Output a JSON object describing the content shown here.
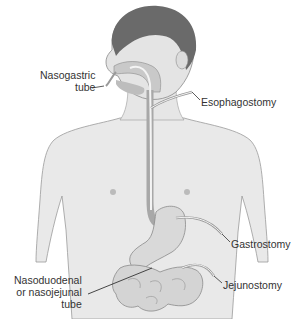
{
  "figure": {
    "colors": {
      "background": "#ffffff",
      "skin": "#e9e9e9",
      "skin_shadow": "#d2d2d2",
      "hair": "#6a6a6a",
      "outline": "#8a8a8a",
      "organ": "#d9d9d9",
      "tube": "#f4f4f4",
      "leader_line": "#333333",
      "text": "#333333"
    }
  },
  "labels": {
    "nasogastric": [
      "Nasogastric",
      "tube"
    ],
    "esophagostomy": "Esophagostomy",
    "gastrostomy": "Gastrostomy",
    "jejunostomy": "Jejunostomy",
    "nasoduodenal": [
      "Nasoduodenal",
      "or nasojejunal",
      "tube"
    ]
  }
}
